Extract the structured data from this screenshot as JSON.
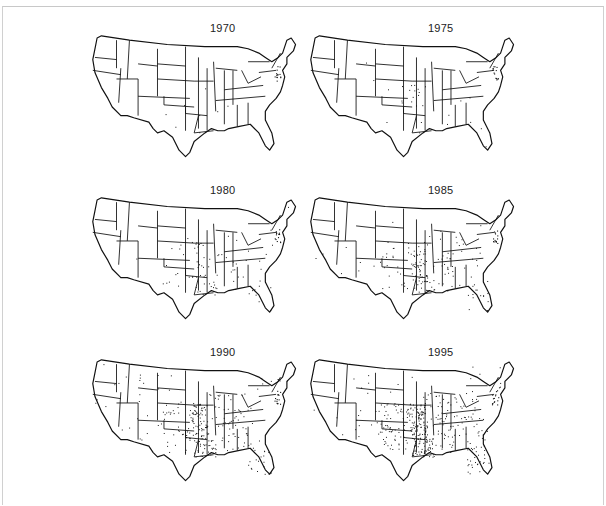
{
  "figure": {
    "type": "small-multiples dot density maps",
    "region": "Contiguous United States (state outlines)",
    "panels": [
      {
        "year": "1970",
        "density": "very sparse",
        "concentration": "Arkansas, Missouri (few dots), mid-Atlantic coast (MD/DE/NJ), Massachusetts"
      },
      {
        "year": "1975",
        "density": "sparse",
        "concentration": "Arkansas, Missouri, eastern Kansas/Oklahoma, mid-Atlantic coast"
      },
      {
        "year": "1980",
        "density": "moderate",
        "concentration": "Arkansas, Missouri, Oklahoma, Texas, Louisiana, Mississippi, Illinois, Tennessee, Kentucky"
      },
      {
        "year": "1985",
        "density": "moderate-high",
        "concentration": "South-central and Southeast: TX, OK, AR, MO, LA, MS, AL, GA, TN, KY, FL, IL, IN"
      },
      {
        "year": "1990",
        "density": "high",
        "concentration": "Entire South and Midwest east of Rockies, spreading into CO, NM, AZ"
      },
      {
        "year": "1995",
        "density": "very high",
        "concentration": "Nearly all states, densest in East/South/Midwest; West sparse but present"
      }
    ]
  },
  "chart_data": {
    "type": "map",
    "title": "",
    "panel_labels": [
      "1970",
      "1975",
      "1980",
      "1985",
      "1990",
      "1995"
    ],
    "layout": {
      "rows": 3,
      "cols": 2
    },
    "relative_dot_density": [
      0.02,
      0.08,
      0.25,
      0.45,
      0.7,
      1.0
    ]
  },
  "colors": {
    "background": "#ffffff",
    "ink": "#111111",
    "frame": "#c8c8c8"
  }
}
